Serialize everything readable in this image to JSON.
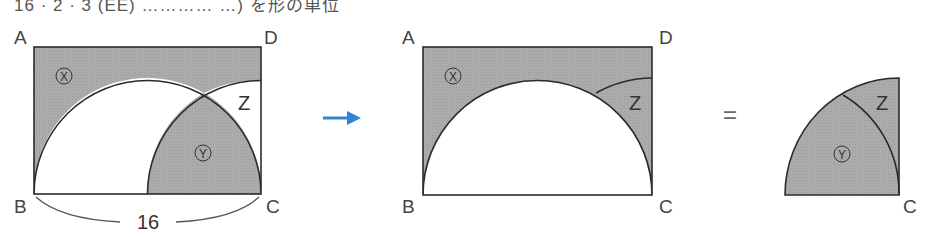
{
  "top_text": "16 · 2 · 3 (EE) ………… …) を形の単位",
  "colors": {
    "shade": "#a9a9a9",
    "stroke": "#2b2b2b",
    "arrow": "#2f86d6",
    "label": "#444444"
  },
  "diagram1": {
    "vertices": {
      "A": "A",
      "B": "B",
      "C": "C",
      "D": "D"
    },
    "regions": {
      "x": "X",
      "y": "Y",
      "z": "Z"
    },
    "length_label": "16"
  },
  "arrow": {
    "icon": "right-arrow-icon"
  },
  "diagram2": {
    "vertices": {
      "A": "A",
      "B": "B",
      "C": "C",
      "D": "D"
    },
    "regions": {
      "x": "X",
      "z": "Z"
    }
  },
  "equals": "=",
  "diagram3": {
    "vertices": {
      "C": "C"
    },
    "regions": {
      "y": "Y",
      "z": "Z"
    }
  }
}
